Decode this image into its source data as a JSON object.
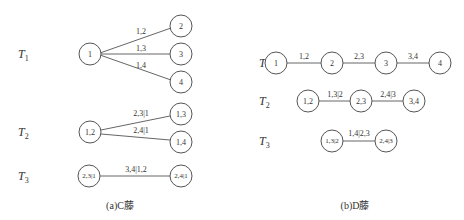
{
  "c_vine": {
    "caption": "(a)C藤",
    "trees": [
      {
        "label": "T",
        "sub": "1",
        "nodes": [
          "1",
          "2",
          "3",
          "4"
        ],
        "edges": [
          {
            "from": "1",
            "to": "2",
            "label": "1,2"
          },
          {
            "from": "1",
            "to": "3",
            "label": "1,3"
          },
          {
            "from": "1",
            "to": "4",
            "label": "1,4"
          }
        ]
      },
      {
        "label": "T",
        "sub": "2",
        "nodes": [
          "1,2",
          "1,3",
          "1,4"
        ],
        "edges": [
          {
            "from": "1,2",
            "to": "1,3",
            "label": "2,3|1"
          },
          {
            "from": "1,2",
            "to": "1,4",
            "label": "2,4|1"
          }
        ]
      },
      {
        "label": "T",
        "sub": "3",
        "nodes": [
          "2,3|1",
          "2,4|1"
        ],
        "edges": [
          {
            "from": "2,3|1",
            "to": "2,4|1",
            "label": "3,4|1,2"
          }
        ]
      }
    ]
  },
  "d_vine": {
    "caption": "(b)D藤",
    "trees": [
      {
        "label": "T",
        "sub": "1",
        "nodes": [
          "1",
          "2",
          "3",
          "4"
        ],
        "edges": [
          {
            "from": "1",
            "to": "2",
            "label": "1,2"
          },
          {
            "from": "2",
            "to": "3",
            "label": "2,3"
          },
          {
            "from": "3",
            "to": "4",
            "label": "3,4"
          }
        ]
      },
      {
        "label": "T",
        "sub": "2",
        "nodes": [
          "1,2",
          "2,3",
          "3,4"
        ],
        "edges": [
          {
            "from": "1,2",
            "to": "2,3",
            "label": "1,3|2"
          },
          {
            "from": "2,3",
            "to": "3,4",
            "label": "2,4|3"
          }
        ]
      },
      {
        "label": "T",
        "sub": "3",
        "nodes": [
          "1,3|2",
          "2,4|3"
        ],
        "edges": [
          {
            "from": "1,3|2",
            "to": "2,4|3",
            "label": "1,4|2,3"
          }
        ]
      }
    ]
  }
}
